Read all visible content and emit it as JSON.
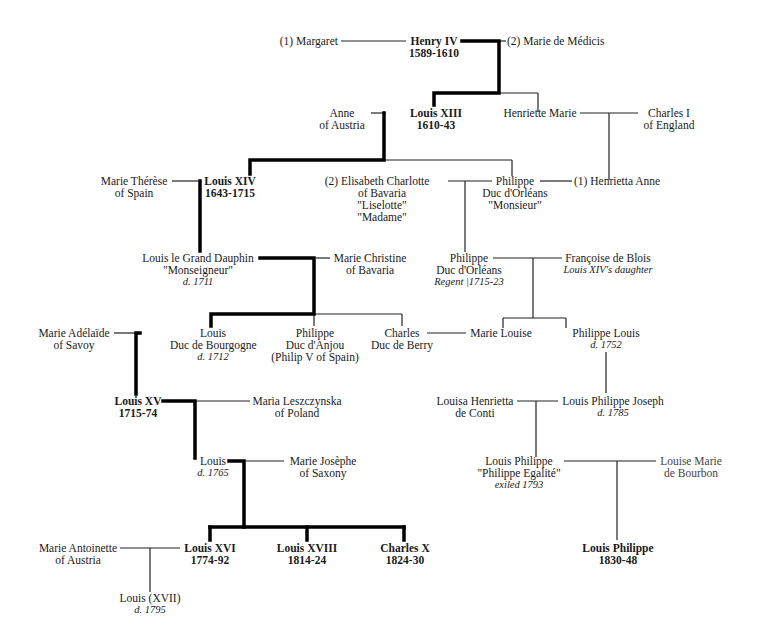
{
  "diagram": {
    "people": {
      "margaret": {
        "lines": [
          "(1)  Margaret"
        ]
      },
      "henry_iv": {
        "lines": [
          "Henry IV",
          "1589-1610"
        ],
        "ruler": true
      },
      "marie_de_medicis": {
        "lines": [
          "(2)  Marie de Médicis"
        ]
      },
      "anne_of_austria": {
        "lines": [
          "Anne",
          "of Austria"
        ]
      },
      "louis_xiii": {
        "lines": [
          "Louis XIII",
          "1610-43"
        ],
        "ruler": true
      },
      "henriette_marie": {
        "lines": [
          "Henriette Marie"
        ]
      },
      "charles_i": {
        "lines": [
          "Charles I",
          "of England"
        ]
      },
      "marie_therese": {
        "lines": [
          "Marie Thérèse",
          "of Spain"
        ]
      },
      "louis_xiv": {
        "lines": [
          "Louis XIV",
          "1643-1715"
        ],
        "ruler": true
      },
      "elisabeth_charlotte": {
        "lines": [
          "(2)  Elisabeth  Charlotte",
          "of Bavaria",
          "\"Liselotte\"",
          "\"Madame\""
        ]
      },
      "philippe_monsieur": {
        "lines": [
          "Philippe",
          "Duc d'Orléans",
          "\"Monsieur\""
        ]
      },
      "henrietta_anne": {
        "lines": [
          "(1)  Henrietta Anne"
        ]
      },
      "grand_dauphin": {
        "lines": [
          "Louis le Grand Dauphin",
          "\"Monseigneur\""
        ],
        "note": "d. 1711"
      },
      "marie_christine": {
        "lines": [
          "Marie Christine",
          "of Bavaria"
        ]
      },
      "philippe_regent": {
        "lines": [
          "Philippe",
          "Duc d'Orléans"
        ],
        "note": "Regent |1715-23"
      },
      "francoise_de_blois": {
        "lines": [
          "Françoise de Blois"
        ],
        "note": "Louis XIV's daughter"
      },
      "marie_adelaide": {
        "lines": [
          "Marie Adélaïde",
          "of Savoy"
        ]
      },
      "louis_bourgogne": {
        "lines": [
          "Louis",
          "Duc de Bourgogne"
        ],
        "note": "d. 1712"
      },
      "philippe_anjou": {
        "lines": [
          "Philippe",
          "Duc d'Anjou",
          "(Philip V of Spain)"
        ]
      },
      "charles_berry": {
        "lines": [
          "Charles",
          "Duc de Berry"
        ]
      },
      "marie_louise": {
        "lines": [
          "Marie Louise"
        ]
      },
      "philippe_louis": {
        "lines": [
          "Philippe Louis"
        ],
        "note": "d. 1752"
      },
      "louis_xv": {
        "lines": [
          "Louis XV",
          "1715-74"
        ],
        "ruler": true
      },
      "maria_leszczynska": {
        "lines": [
          "Maria Leszczynska",
          "of Poland"
        ]
      },
      "louisa_henrietta": {
        "lines": [
          "Louisa Henrietta",
          "de Conti"
        ]
      },
      "louis_philippe_joseph": {
        "lines": [
          "Louis Philippe Joseph"
        ],
        "note": "d. 1785"
      },
      "louis_dauphin": {
        "lines": [
          "Louis"
        ],
        "note": "d. 1765"
      },
      "marie_josephe": {
        "lines": [
          "Marie Josèphe",
          "of Saxony"
        ]
      },
      "louis_philippe_egalite": {
        "lines": [
          "Louis Philippe",
          "\"Philippe Egalité\""
        ],
        "note": "exiled 1793"
      },
      "louise_marie": {
        "lines": [
          "Louise Marie",
          "de Bourbon"
        ]
      },
      "marie_antoinette": {
        "lines": [
          "Marie Antoinette",
          "of Austria"
        ]
      },
      "louis_xvi": {
        "lines": [
          "Louis XVI",
          "1774-92"
        ],
        "ruler": true
      },
      "louis_xviii": {
        "lines": [
          "Louis XVIII",
          "1814-24"
        ],
        "ruler": true
      },
      "charles_x": {
        "lines": [
          "Charles X",
          "1824-30"
        ],
        "ruler": true
      },
      "louis_philippe_king": {
        "lines": [
          "Louis Philippe",
          "1830-48"
        ],
        "ruler": true
      },
      "louis_xvii": {
        "lines": [
          "Louis  (XVII)"
        ],
        "note": "d. 1795"
      }
    },
    "line_colors": {
      "succession": "#000000",
      "family": "#222222"
    }
  }
}
